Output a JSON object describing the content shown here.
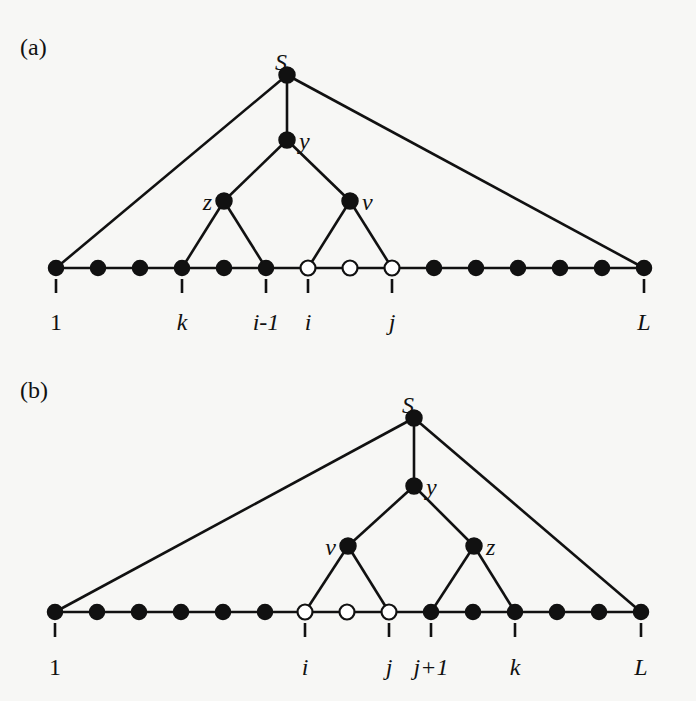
{
  "panels": [
    {
      "id": "a",
      "label": "(a)",
      "label_pos": [
        20,
        55
      ],
      "baseline_y": 268,
      "tick_len": 14,
      "label_y": 330,
      "leaves": [
        {
          "x": 56,
          "type": "filled",
          "tick": true,
          "label": "1",
          "upright": true
        },
        {
          "x": 98,
          "type": "filled",
          "tick": false,
          "label": ""
        },
        {
          "x": 140,
          "type": "filled",
          "tick": false,
          "label": ""
        },
        {
          "x": 182,
          "type": "filled",
          "tick": true,
          "label": "k"
        },
        {
          "x": 224,
          "type": "filled",
          "tick": false,
          "label": ""
        },
        {
          "x": 266,
          "type": "filled",
          "tick": true,
          "label": "i-1"
        },
        {
          "x": 308,
          "type": "open",
          "tick": true,
          "label": "i"
        },
        {
          "x": 350,
          "type": "open",
          "tick": false,
          "label": ""
        },
        {
          "x": 392,
          "type": "open",
          "tick": true,
          "label": "j"
        },
        {
          "x": 434,
          "type": "filled",
          "tick": false,
          "label": ""
        },
        {
          "x": 476,
          "type": "filled",
          "tick": false,
          "label": ""
        },
        {
          "x": 518,
          "type": "filled",
          "tick": false,
          "label": ""
        },
        {
          "x": 560,
          "type": "filled",
          "tick": false,
          "label": ""
        },
        {
          "x": 602,
          "type": "filled",
          "tick": false,
          "label": ""
        },
        {
          "x": 644,
          "type": "filled",
          "tick": true,
          "label": "L"
        }
      ],
      "internal_nodes": [
        {
          "id": "S",
          "x": 287,
          "y": 75,
          "label": "S",
          "label_dx": -6,
          "label_dy": -12,
          "anchor": "middle"
        },
        {
          "id": "y",
          "x": 287,
          "y": 140,
          "label": "y",
          "label_dx": 12,
          "label_dy": 2,
          "anchor": "start"
        },
        {
          "id": "z",
          "x": 224,
          "y": 201,
          "label": "z",
          "label_dx": -12,
          "label_dy": 2,
          "anchor": "end"
        },
        {
          "id": "v",
          "x": 350,
          "y": 201,
          "label": "v",
          "label_dx": 12,
          "label_dy": 2,
          "anchor": "start"
        }
      ],
      "edges": [
        [
          "S",
          "leaf:0"
        ],
        [
          "S",
          "y"
        ],
        [
          "S",
          "leaf:14"
        ],
        [
          "y",
          "z"
        ],
        [
          "y",
          "v"
        ],
        [
          "z",
          "leaf:3"
        ],
        [
          "z",
          "leaf:5"
        ],
        [
          "v",
          "leaf:6"
        ],
        [
          "v",
          "leaf:8"
        ]
      ]
    },
    {
      "id": "b",
      "label": "(b)",
      "label_pos": [
        20,
        398
      ],
      "baseline_y": 612,
      "tick_len": 14,
      "label_y": 675,
      "leaves": [
        {
          "x": 55,
          "type": "filled",
          "tick": true,
          "label": "1",
          "upright": true
        },
        {
          "x": 97,
          "type": "filled",
          "tick": false,
          "label": ""
        },
        {
          "x": 139,
          "type": "filled",
          "tick": false,
          "label": ""
        },
        {
          "x": 181,
          "type": "filled",
          "tick": false,
          "label": ""
        },
        {
          "x": 223,
          "type": "filled",
          "tick": false,
          "label": ""
        },
        {
          "x": 265,
          "type": "filled",
          "tick": false,
          "label": ""
        },
        {
          "x": 305,
          "type": "open",
          "tick": true,
          "label": "i"
        },
        {
          "x": 347,
          "type": "open",
          "tick": false,
          "label": ""
        },
        {
          "x": 389,
          "type": "open",
          "tick": true,
          "label": "j"
        },
        {
          "x": 431,
          "type": "filled",
          "tick": true,
          "label": "j+1"
        },
        {
          "x": 473,
          "type": "filled",
          "tick": false,
          "label": ""
        },
        {
          "x": 515,
          "type": "filled",
          "tick": true,
          "label": "k"
        },
        {
          "x": 557,
          "type": "filled",
          "tick": false,
          "label": ""
        },
        {
          "x": 599,
          "type": "filled",
          "tick": false,
          "label": ""
        },
        {
          "x": 641,
          "type": "filled",
          "tick": true,
          "label": "L"
        }
      ],
      "internal_nodes": [
        {
          "id": "S",
          "x": 414,
          "y": 418,
          "label": "S",
          "label_dx": -6,
          "label_dy": -12,
          "anchor": "middle"
        },
        {
          "id": "y",
          "x": 414,
          "y": 486,
          "label": "y",
          "label_dx": 12,
          "label_dy": 2,
          "anchor": "start"
        },
        {
          "id": "v",
          "x": 348,
          "y": 546,
          "label": "v",
          "label_dx": -12,
          "label_dy": 2,
          "anchor": "end"
        },
        {
          "id": "z",
          "x": 474,
          "y": 546,
          "label": "z",
          "label_dx": 12,
          "label_dy": 2,
          "anchor": "start"
        }
      ],
      "edges": [
        [
          "S",
          "leaf:0"
        ],
        [
          "S",
          "y"
        ],
        [
          "S",
          "leaf:14"
        ],
        [
          "y",
          "v"
        ],
        [
          "y",
          "z"
        ],
        [
          "v",
          "leaf:6"
        ],
        [
          "v",
          "leaf:8"
        ],
        [
          "z",
          "leaf:9"
        ],
        [
          "z",
          "leaf:11"
        ]
      ]
    }
  ],
  "style": {
    "stroke_color": "#111111",
    "open_fill": "#ffffff",
    "background": "#f7f7f5",
    "node_radius": 7.5
  }
}
